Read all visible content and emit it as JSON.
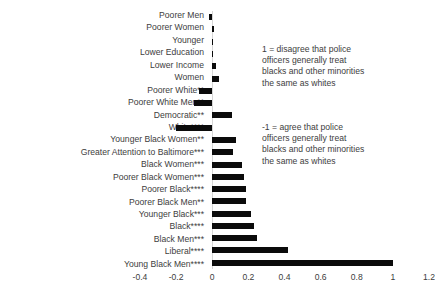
{
  "chart_data": {
    "type": "bar",
    "orientation": "horizontal",
    "title": "",
    "xlabel": "",
    "ylabel": "",
    "xlim": [
      -0.4,
      1.2
    ],
    "xticks": [
      "-0.4",
      "-0.2",
      "0",
      "0.2",
      "0.4",
      "0.6",
      "0.8",
      "1",
      "1.2"
    ],
    "xtick_values": [
      -0.4,
      -0.2,
      0,
      0.2,
      0.4,
      0.6,
      0.8,
      1.0,
      1.2
    ],
    "grid": false,
    "legend": "none",
    "bar_color": "#0b0b0b",
    "categories": [
      "Poorer Men",
      "Poorer Women",
      "Younger",
      "Lower Education",
      "Lower Income",
      "Women",
      "Poorer White**",
      "Poorer White Men**",
      "Democratic**",
      "White****",
      "Younger Black Women**",
      "Greater Attention to Baltimore***",
      "Black Women***",
      "Poorer Black Women***",
      "Poorer Black****",
      "Poorer Black Men**",
      "Younger Black***",
      "Black****",
      "Black Men***",
      "Liberal****",
      "Young Black Men****"
    ],
    "values": [
      -0.02,
      0.01,
      0.005,
      0.005,
      0.02,
      0.035,
      -0.075,
      -0.1,
      0.11,
      -0.2,
      0.13,
      0.115,
      0.165,
      0.175,
      0.185,
      0.185,
      0.215,
      0.23,
      0.25,
      0.42,
      1.0
    ],
    "annotations": [
      {
        "id": "positive",
        "text": "1 = disagree that police officers generally treat blacks and other minorities the same as whites"
      },
      {
        "id": "negative",
        "text": "-1 = agree that police officers generally treat blacks and other minorities the same as whites"
      }
    ]
  }
}
